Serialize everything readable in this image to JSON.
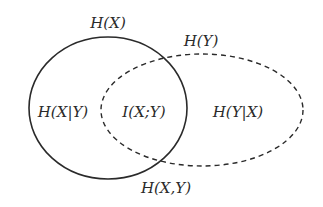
{
  "diagram": {
    "type": "venn",
    "colors": {
      "stroke": "#2a2a2a",
      "text": "#2a2a2a",
      "background": "#ffffff"
    },
    "sets": [
      {
        "id": "X",
        "label": "H(X)",
        "style": "solid"
      },
      {
        "id": "Y",
        "label": "H(Y)",
        "style": "dashed"
      }
    ],
    "regions": {
      "x_only": "H(X|Y)",
      "intersection": "I(X;Y)",
      "y_only": "H(Y|X)"
    },
    "union_label": "H(X,Y)"
  }
}
